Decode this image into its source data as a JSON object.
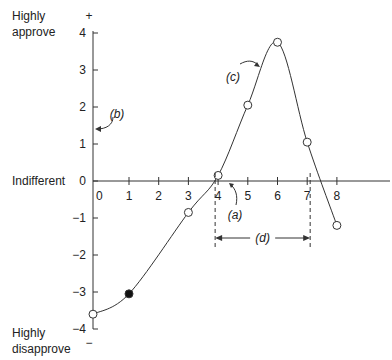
{
  "chart_data": {
    "type": "line",
    "title": "",
    "xlabel": "",
    "ylabel": "",
    "y_side_labels": {
      "top": [
        "Highly",
        "approve"
      ],
      "middle": "Indifferent",
      "bottom": [
        "Highly",
        "disapprove"
      ],
      "plus": "+",
      "minus": "−"
    },
    "xlim": [
      0,
      9
    ],
    "ylim": [
      -4,
      4
    ],
    "x_ticks": [
      0,
      1,
      2,
      3,
      4,
      5,
      6,
      7,
      8
    ],
    "x_tick_labels": [
      "0",
      "1",
      "2",
      "3",
      "4",
      "5",
      "6",
      "7",
      "8"
    ],
    "y_ticks": [
      4,
      3,
      2,
      1,
      0,
      -1,
      -2,
      -3,
      -4
    ],
    "y_tick_labels": [
      "4",
      "3",
      "2",
      "1",
      "0",
      "−1",
      "−2",
      "−3",
      "−4"
    ],
    "grid": false,
    "series": [
      {
        "name": "attitude curve",
        "points": [
          {
            "x": -0.2,
            "y": -3.6,
            "filled": false
          },
          {
            "x": 1,
            "y": -3.05,
            "filled": true
          },
          {
            "x": 3,
            "y": -0.85,
            "filled": false
          },
          {
            "x": 4,
            "y": 0.15,
            "filled": false
          },
          {
            "x": 5,
            "y": 2.05,
            "filled": false
          },
          {
            "x": 6,
            "y": 3.75,
            "filled": false
          },
          {
            "x": 7,
            "y": 1.05,
            "filled": false
          },
          {
            "x": 8,
            "y": -1.2,
            "filled": false
          }
        ]
      }
    ],
    "annotations": [
      {
        "label": "(a)",
        "points_to": "zero crossing near x=4"
      },
      {
        "label": "(b)",
        "points_to": "y-axis at about 1.4"
      },
      {
        "label": "(c)",
        "points_to": "rising curve near x=5.5"
      },
      {
        "label": "(d)",
        "points_to": "range between zero crossings, x≈3.9 to x≈7.1"
      }
    ]
  }
}
